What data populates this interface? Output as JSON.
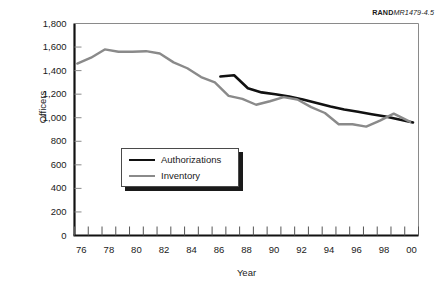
{
  "figure": {
    "source_tag_brand": "RAND",
    "source_tag_doc": "MR1479-4.5"
  },
  "chart_data": {
    "type": "line",
    "title": "",
    "xlabel": "Year",
    "ylabel": "Officers",
    "xlim": [
      76,
      101
    ],
    "ylim": [
      0,
      1800
    ],
    "ytick_values": [
      0,
      200,
      400,
      600,
      800,
      1000,
      1200,
      1400,
      1600,
      1800
    ],
    "ytick_labels": [
      "0",
      "200",
      "400",
      "600",
      "800",
      "1,000",
      "1,200",
      "1,400",
      "1,600",
      "1,800"
    ],
    "xtick_values": [
      76,
      78,
      80,
      82,
      84,
      86,
      88,
      90,
      92,
      94,
      96,
      98,
      100
    ],
    "xtick_labels": [
      "76",
      "78",
      "80",
      "82",
      "84",
      "86",
      "88",
      "90",
      "92",
      "94",
      "96",
      "98",
      "00"
    ],
    "x_minor_ticks": [
      76,
      77,
      78,
      79,
      80,
      81,
      82,
      83,
      84,
      85,
      86,
      87,
      88,
      89,
      90,
      91,
      92,
      93,
      94,
      95,
      96,
      97,
      98,
      99,
      100,
      101
    ],
    "grid": false,
    "legend_position": "center-left",
    "series": [
      {
        "name": "Authorizations",
        "color": "#111111",
        "x": [
          86.6,
          87.6,
          88.6,
          89.6,
          90.6,
          91.6,
          92.6,
          93.6,
          94.6,
          95.6,
          96.6,
          97.6,
          98.6,
          99.6,
          100.6
        ],
        "values": [
          1350,
          1360,
          1250,
          1215,
          1200,
          1180,
          1155,
          1125,
          1095,
          1070,
          1050,
          1030,
          1010,
          985,
          960
        ]
      },
      {
        "name": "Inventory",
        "color": "#8a8a8a",
        "x": [
          76.2,
          77.2,
          78.2,
          79.2,
          80.2,
          81.2,
          82.2,
          83.2,
          84.2,
          85.2,
          86.2,
          87.2,
          88.2,
          89.2,
          90.2,
          91.2,
          92.2,
          93.2,
          94.2,
          95.2,
          96.2,
          97.2,
          98.2,
          99.2,
          100.4
        ],
        "values": [
          1460,
          1510,
          1580,
          1560,
          1560,
          1565,
          1545,
          1470,
          1420,
          1345,
          1300,
          1185,
          1160,
          1110,
          1140,
          1175,
          1155,
          1090,
          1040,
          945,
          945,
          925,
          975,
          1035,
          965
        ]
      }
    ]
  },
  "legend": {
    "items": [
      {
        "label": "Authorizations"
      },
      {
        "label": "Inventory"
      }
    ]
  }
}
